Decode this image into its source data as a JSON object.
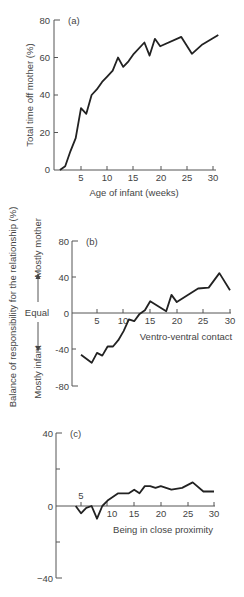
{
  "chart_data": [
    {
      "type": "line",
      "panel": "(a)",
      "title": "",
      "xlabel": "Age of infant (weeks)",
      "ylabel": "Total time off mother (%)",
      "xlim": [
        0,
        31
      ],
      "ylim": [
        0,
        80
      ],
      "xticks": [
        5,
        10,
        15,
        20,
        25,
        30
      ],
      "yticks": [
        0,
        20,
        40,
        60,
        80
      ],
      "grid": false,
      "series": [
        {
          "name": "Total time off mother",
          "x": [
            1,
            2,
            3,
            4,
            5,
            6,
            7,
            8,
            9,
            10,
            11,
            12,
            13,
            14,
            15,
            17,
            18,
            19,
            20,
            24,
            26,
            28,
            31
          ],
          "values": [
            0,
            2,
            10,
            17,
            33,
            30,
            40,
            43,
            47,
            50,
            53,
            60,
            55,
            58,
            62,
            68,
            61,
            70,
            66,
            71,
            62,
            67,
            72
          ]
        }
      ]
    },
    {
      "type": "line",
      "panel": "(b)",
      "xlabel": "Ventro-ventral contact",
      "ylabel": "Balance of responsibility for the relationship (%)",
      "xlim": [
        0,
        30
      ],
      "ylim": [
        -80,
        80
      ],
      "xticks": [
        5,
        10,
        15,
        20,
        25,
        30
      ],
      "yticks": [
        -80,
        -40,
        0,
        40,
        80
      ],
      "grid": false,
      "series": [
        {
          "name": "Ventro-ventral contact",
          "x": [
            2,
            4,
            5,
            6,
            7,
            8,
            9,
            10,
            11,
            12,
            13,
            14,
            15,
            18,
            19,
            20,
            24,
            26,
            28,
            30
          ],
          "values": [
            -46,
            -55,
            -44,
            -47,
            -37,
            -37,
            -30,
            -20,
            -7,
            -9,
            -1,
            3,
            13,
            2,
            20,
            12,
            27,
            28,
            44,
            25
          ]
        }
      ]
    },
    {
      "type": "line",
      "panel": "(c)",
      "xlabel": "Being in close proximity",
      "ylabel": "Balance of responsibility for the relationship (%)",
      "xlim": [
        0,
        30
      ],
      "ylim": [
        -40,
        40
      ],
      "xticks": [
        5,
        10,
        15,
        20,
        25,
        30
      ],
      "yticks": [
        -40,
        0,
        40
      ],
      "grid": false,
      "series": [
        {
          "name": "Being in close proximity",
          "x": [
            4,
            5,
            6,
            7,
            8,
            9,
            10,
            12,
            14,
            15,
            16,
            17,
            18,
            19,
            20,
            22,
            24,
            26,
            28,
            30
          ],
          "values": [
            0,
            -4,
            -1,
            0,
            -7,
            0,
            3,
            7,
            7,
            9,
            7,
            11,
            11,
            10,
            11,
            9,
            10,
            13,
            8,
            8
          ]
        }
      ]
    }
  ],
  "labels": {
    "panel_a": "(a)",
    "panel_b": "(b)",
    "panel_c": "(c)",
    "a_ylabel": "Total time off mother (%)",
    "a_xlabel": "Age of infant (weeks)",
    "shared_ylabel": "Balance of responsibility for the relationship (%)",
    "mostly_mother": "Mostly mother",
    "equal": "Equal",
    "mostly_infant": "Mostly infant",
    "b_xlabel": "Ventro-ventral contact",
    "c_xlabel": "Being in close proximity"
  },
  "ticks": {
    "a_y": [
      "0",
      "20",
      "40",
      "60",
      "80"
    ],
    "a_x": [
      "5",
      "10",
      "15",
      "20",
      "25",
      "30"
    ],
    "b_y": [
      "80",
      "40",
      "0",
      "-40",
      "-80"
    ],
    "b_x": [
      "5",
      "10",
      "15",
      "20",
      "25",
      "30"
    ],
    "c_y": [
      "40",
      "0",
      "−40"
    ],
    "c_x": [
      "5",
      "10",
      "15",
      "20",
      "25",
      "30"
    ]
  }
}
